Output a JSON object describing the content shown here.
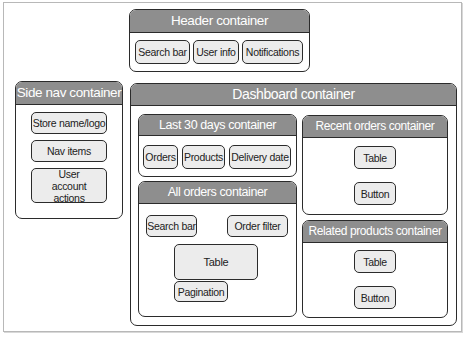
{
  "diagram": {
    "header": {
      "title": "Header container",
      "items": [
        "Search bar",
        "User info",
        "Notifications"
      ]
    },
    "side_nav": {
      "title": "Side nav container",
      "items": [
        "Store name/logo",
        "Nav items",
        "User account actions"
      ]
    },
    "dashboard": {
      "title": "Dashboard container",
      "last_30_days": {
        "title": "Last 30 days container",
        "items": [
          "Orders",
          "Products",
          "Delivery date"
        ]
      },
      "all_orders": {
        "title": "All orders container",
        "items": [
          "Search bar",
          "Order filter",
          "Table",
          "Pagination"
        ]
      },
      "recent_orders": {
        "title": "Recent orders container",
        "items": [
          "Table",
          "Button"
        ]
      },
      "related_products": {
        "title": "Related products container",
        "items": [
          "Table",
          "Button"
        ]
      }
    }
  },
  "colors": {
    "bar": "#8e8e8e",
    "item_fill": "#ececec",
    "border": "#2b2b2b"
  }
}
